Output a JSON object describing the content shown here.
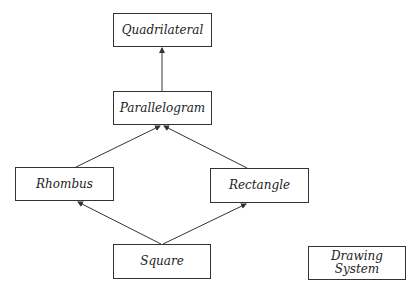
{
  "diagram": {
    "type": "class-hierarchy",
    "nodes": [
      {
        "id": "quadrilateral",
        "label": "Quadrilateral",
        "x": 113,
        "y": 13,
        "w": 99,
        "h": 34
      },
      {
        "id": "parallelogram",
        "label": "Parallelogram",
        "x": 113,
        "y": 91,
        "w": 99,
        "h": 34
      },
      {
        "id": "rhombus",
        "label": "Rhombus",
        "x": 15,
        "y": 167,
        "w": 99,
        "h": 34
      },
      {
        "id": "rectangle",
        "label": "Rectangle",
        "x": 210,
        "y": 168,
        "w": 99,
        "h": 35
      },
      {
        "id": "square",
        "label": "Square",
        "x": 113,
        "y": 244,
        "w": 98,
        "h": 35
      },
      {
        "id": "drawing-system",
        "label_line1": "Drawing",
        "label_line2": "System",
        "x": 308,
        "y": 246,
        "w": 98,
        "h": 34
      }
    ],
    "edges": [
      {
        "from": "parallelogram",
        "to": "quadrilateral"
      },
      {
        "from": "rhombus",
        "to": "parallelogram"
      },
      {
        "from": "rectangle",
        "to": "parallelogram"
      },
      {
        "from": "square",
        "to": "rhombus"
      },
      {
        "from": "square",
        "to": "rectangle"
      }
    ],
    "colors": {
      "line": "#333333",
      "background": "#ffffff"
    }
  }
}
